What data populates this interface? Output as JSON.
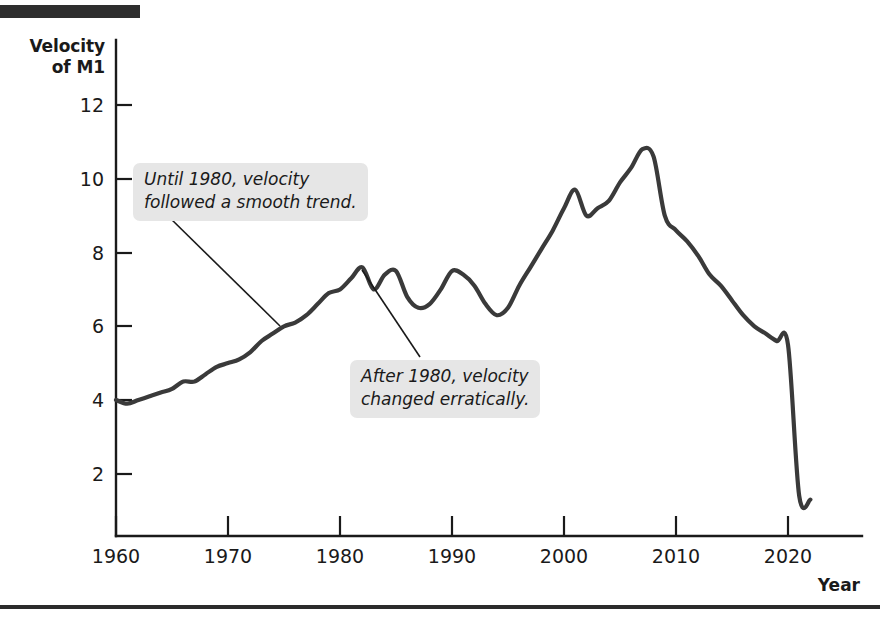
{
  "figure": {
    "y_axis_title_line1": "Velocity",
    "y_axis_title_line2": "of M1",
    "x_axis_title": "Year"
  },
  "annotations": [
    {
      "id": "callout-1",
      "line1": "Until 1980, velocity",
      "line2": "followed a smooth trend."
    },
    {
      "id": "callout-2",
      "line1": "After 1980, velocity",
      "line2": "changed erratically."
    }
  ],
  "chart_data": {
    "type": "line",
    "title": "",
    "xlabel": "Year",
    "ylabel": "Velocity of M1",
    "xlim": [
      1960,
      2022
    ],
    "ylim": [
      0,
      13
    ],
    "xticks": [
      1960,
      1970,
      1980,
      1990,
      2000,
      2010,
      2020
    ],
    "yticks": [
      2,
      4,
      6,
      8,
      10,
      12
    ],
    "grid": false,
    "legend": null,
    "series": [
      {
        "name": "Velocity of M1",
        "x": [
          1960,
          1961,
          1962,
          1963,
          1964,
          1965,
          1966,
          1967,
          1968,
          1969,
          1970,
          1971,
          1972,
          1973,
          1974,
          1975,
          1976,
          1977,
          1978,
          1979,
          1980,
          1981,
          1982,
          1983,
          1984,
          1985,
          1986,
          1987,
          1988,
          1989,
          1990,
          1991,
          1992,
          1993,
          1994,
          1995,
          1996,
          1997,
          1998,
          1999,
          2000,
          2001,
          2002,
          2003,
          2004,
          2005,
          2006,
          2007,
          2008,
          2009,
          2010,
          2011,
          2012,
          2013,
          2014,
          2015,
          2016,
          2017,
          2018,
          2019,
          2020,
          2021,
          2022
        ],
        "values": [
          4.0,
          3.9,
          4.0,
          4.1,
          4.2,
          4.3,
          4.5,
          4.5,
          4.7,
          4.9,
          5.0,
          5.1,
          5.3,
          5.6,
          5.8,
          6.0,
          6.1,
          6.3,
          6.6,
          6.9,
          7.0,
          7.3,
          7.6,
          7.0,
          7.4,
          7.5,
          6.8,
          6.5,
          6.6,
          7.0,
          7.5,
          7.4,
          7.1,
          6.6,
          6.3,
          6.5,
          7.1,
          7.6,
          8.1,
          8.6,
          9.2,
          9.7,
          9.0,
          9.2,
          9.4,
          9.9,
          10.3,
          10.8,
          10.6,
          9.0,
          8.6,
          8.3,
          7.9,
          7.4,
          7.1,
          6.7,
          6.3,
          6.0,
          5.8,
          5.6,
          5.5,
          1.4,
          1.3
        ]
      }
    ],
    "notes": [
      "Until 1980, velocity followed a smooth trend.",
      "After 1980, velocity changed erratically.",
      "Sharp 2020 discontinuity reflects the redefinition of M1."
    ]
  }
}
